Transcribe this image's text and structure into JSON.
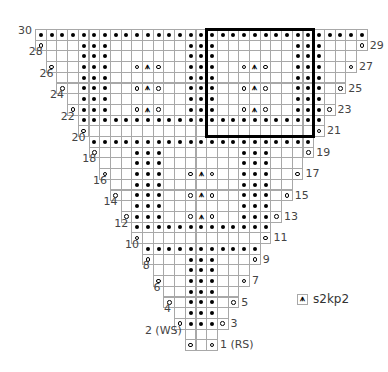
{
  "chart": {
    "type": "knitting-chart",
    "total_rows": 30,
    "max_stitches": 31,
    "legend": [
      {
        "symbol": "s2kp2-symbol",
        "glyph": "⩚",
        "label": "s2kp2"
      }
    ],
    "symbols": {
      "blank": "knit (RS) / purl (WS)",
      "dot": "purl (RS) / knit (WS)",
      "yo": "yo",
      "A": "s2kp2"
    },
    "repeat_box": {
      "first_col": 16,
      "last_col": 25,
      "top_row": 30,
      "bottom_row": 21
    },
    "rows": [
      {
        "row": 30,
        "label": "30",
        "side": "left",
        "first_col": 0,
        "cells": "*******************************"
      },
      {
        "row": 29,
        "label": "29",
        "side": "right",
        "first_col": 0,
        "cells": "o...***.......***.......***...o"
      },
      {
        "row": 28,
        "label": "28",
        "side": "left",
        "first_col": 1,
        "cells": "...***.......***.......***..."
      },
      {
        "row": 27,
        "label": "27",
        "side": "right",
        "first_col": 1,
        "cells": "o..***..oAo..***..oAo..***..o"
      },
      {
        "row": 26,
        "label": "26",
        "side": "left",
        "first_col": 2,
        "cells": "..***.......***.......***.."
      },
      {
        "row": 25,
        "label": "25",
        "side": "right",
        "first_col": 2,
        "cells": "o.***..oAo..***..oAo..***.o"
      },
      {
        "row": 24,
        "label": "24",
        "side": "left",
        "first_col": 3,
        "cells": ".***.......***.......***."
      },
      {
        "row": 23,
        "label": "23",
        "side": "right",
        "first_col": 3,
        "cells": "o***..oAo..***..oAo..***o"
      },
      {
        "row": 22,
        "label": "22",
        "side": "left",
        "first_col": 4,
        "cells": "***********************"
      },
      {
        "row": 21,
        "label": "21",
        "side": "right",
        "first_col": 4,
        "cells": "o.....................o"
      },
      {
        "row": 20,
        "label": "20",
        "side": "left",
        "first_col": 5,
        "cells": "*********************"
      },
      {
        "row": 19,
        "label": "19",
        "side": "right",
        "first_col": 5,
        "cells": "o...***.......***...o"
      },
      {
        "row": 18,
        "label": "18",
        "side": "left",
        "first_col": 6,
        "cells": "...***.......***..."
      },
      {
        "row": 17,
        "label": "17",
        "side": "right",
        "first_col": 6,
        "cells": "o..***..oAo..***..o"
      },
      {
        "row": 16,
        "label": "16",
        "side": "left",
        "first_col": 7,
        "cells": "..***.......***.."
      },
      {
        "row": 15,
        "label": "15",
        "side": "right",
        "first_col": 7,
        "cells": "o.***..oAo..***.o"
      },
      {
        "row": 14,
        "label": "14",
        "side": "left",
        "first_col": 8,
        "cells": ".***.......***."
      },
      {
        "row": 13,
        "label": "13",
        "side": "right",
        "first_col": 8,
        "cells": "o***..oAo..***o"
      },
      {
        "row": 12,
        "label": "12",
        "side": "left",
        "first_col": 9,
        "cells": "*************"
      },
      {
        "row": 11,
        "label": "11",
        "side": "right",
        "first_col": 9,
        "cells": "o...........o"
      },
      {
        "row": 10,
        "label": "10",
        "side": "left",
        "first_col": 10,
        "cells": "***********"
      },
      {
        "row": 9,
        "label": "9",
        "side": "right",
        "first_col": 10,
        "cells": "o...***...o"
      },
      {
        "row": 8,
        "label": "8",
        "side": "left",
        "first_col": 11,
        "cells": "...***..."
      },
      {
        "row": 7,
        "label": "7",
        "side": "right",
        "first_col": 11,
        "cells": "o..***..o"
      },
      {
        "row": 6,
        "label": "6",
        "side": "left",
        "first_col": 12,
        "cells": "..***.."
      },
      {
        "row": 5,
        "label": "5",
        "side": "right",
        "first_col": 12,
        "cells": "o.***.o"
      },
      {
        "row": 4,
        "label": "4",
        "side": "left",
        "first_col": 13,
        "cells": ".***."
      },
      {
        "row": 3,
        "label": "3",
        "side": "right",
        "first_col": 13,
        "cells": "o***o"
      },
      {
        "row": 2,
        "label": "2 (WS)",
        "side": "left",
        "first_col": 14,
        "cells": "..."
      },
      {
        "row": 1,
        "label": "1 (RS)",
        "side": "right",
        "first_col": 14,
        "cells": "o.o"
      }
    ]
  }
}
